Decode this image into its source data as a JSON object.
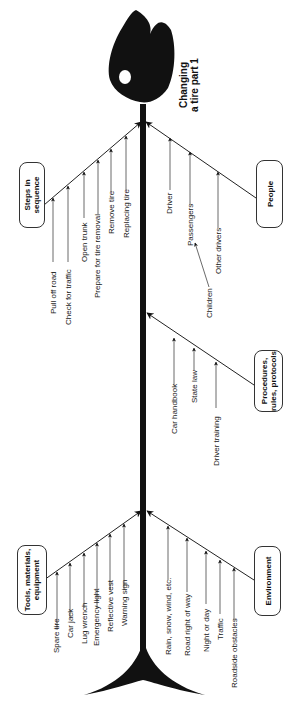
{
  "diagram": {
    "type": "fishbone",
    "title": "Changing\na tire part 1",
    "colors": {
      "ink": "#111111",
      "line": "#333333",
      "background": "#ffffff"
    },
    "categories": [
      {
        "id": "steps",
        "label": "Steps in\nsequence",
        "side": "left",
        "items": [
          "Pull off road",
          "Check for traffic",
          "Open trunk",
          "Prepare for tire removal",
          "Remove tire",
          "Replacing tire"
        ]
      },
      {
        "id": "people",
        "label": "People",
        "side": "right",
        "items": [
          "Driver",
          "Passengers",
          "Other drivers"
        ],
        "sub_items": [
          {
            "label": "Children",
            "parent": "Passengers"
          }
        ]
      },
      {
        "id": "procedures",
        "label": "Procedures,\nrules, protocols",
        "side": "right",
        "items": [
          "Car handbook",
          "State law",
          "Driver training"
        ]
      },
      {
        "id": "tools",
        "label": "Tools, materials,\nequipment",
        "side": "left",
        "items": [
          "Spare tire",
          "Car jack",
          "Lug wrench",
          "Emergency light",
          "Reflective vest",
          "Warning sign"
        ]
      },
      {
        "id": "environment",
        "label": "Environment",
        "side": "right",
        "items": [
          "Rain, snow, wind, etc.",
          "Road right of way",
          "Night or day",
          "Traffic",
          "Roadside obstacles"
        ]
      }
    ]
  }
}
